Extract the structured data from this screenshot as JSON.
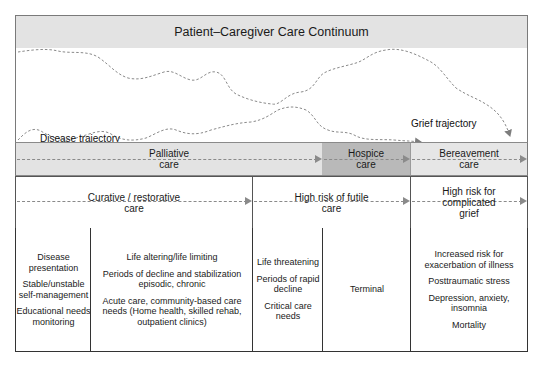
{
  "title": "Patient–Caregiver Care Continuum",
  "trajectories": {
    "disease_label": "Disease trajectory",
    "grief_label": "Grief trajectory"
  },
  "care_phases": [
    {
      "label": "Palliative care",
      "line1": "Palliative",
      "line2": "care",
      "fill": "#e3e3e3"
    },
    {
      "label": "Hospice care",
      "line1": "Hospice",
      "line2": "care",
      "fill": "#b9b9b9"
    },
    {
      "label": "Bereavement care",
      "line1": "Bereavement",
      "line2": "care",
      "fill": "#e6e6e6"
    }
  ],
  "care_goals": [
    {
      "line1": "Curative / restorative",
      "line2": "care"
    },
    {
      "line1": "High risk of futile",
      "line2": "care"
    },
    {
      "line1": "High risk for",
      "line2": "complicated",
      "line3": "grief"
    }
  ],
  "details": [
    {
      "items": [
        "Disease presentation",
        "Stable/unstable self-management",
        "Educational needs monitoring"
      ]
    },
    {
      "items": [
        "Life altering/life limiting",
        "Periods of decline and stabilization episodic, chronic",
        "Acute care, community-based care needs (Home health, skilled rehab, outpatient clinics)"
      ]
    },
    {
      "items": [
        "Life threatening",
        "Periods of rapid decline",
        "Critical care needs"
      ]
    },
    {
      "items": [
        "Terminal"
      ]
    },
    {
      "items": [
        "Increased risk for exacerbation of illness",
        "Posttraumatic stress",
        "Depression, anxiety, insomnia",
        "Mortality"
      ]
    }
  ]
}
